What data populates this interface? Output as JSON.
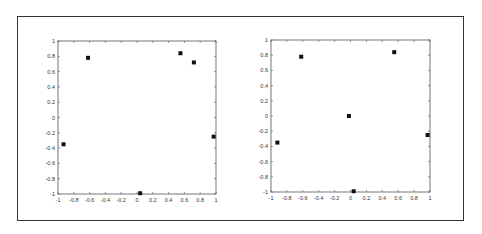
{
  "chart_data": [
    {
      "type": "scatter",
      "title": "",
      "xlabel": "",
      "ylabel": "",
      "xlim": [
        -1,
        1
      ],
      "ylim": [
        -1,
        1
      ],
      "grid": false,
      "marker": "square",
      "marker_color": "#111111",
      "x_ticks": [
        "-1",
        "-0.8",
        "-0.6",
        "-0.4",
        "-0.2",
        "0",
        "0.2",
        "0.4",
        "0.6",
        "0.8",
        "1"
      ],
      "y_ticks": [
        "1",
        "0.8",
        "0.6",
        "0.4",
        "0.2",
        "0",
        "-0.2",
        "-0.4",
        "-0.6",
        "-0.8",
        "-1"
      ],
      "points": [
        {
          "x": -0.93,
          "y": -0.35
        },
        {
          "x": -0.62,
          "y": 0.78
        },
        {
          "x": 0.04,
          "y": -0.99
        },
        {
          "x": 0.55,
          "y": 0.84
        },
        {
          "x": 0.72,
          "y": 0.72
        },
        {
          "x": 0.97,
          "y": -0.25
        }
      ]
    },
    {
      "type": "scatter",
      "title": "",
      "xlabel": "",
      "ylabel": "",
      "xlim": [
        -1,
        1
      ],
      "ylim": [
        -1,
        1
      ],
      "grid": false,
      "marker": "square",
      "marker_color": "#111111",
      "x_ticks": [
        "-1",
        "-0.8",
        "-0.6",
        "-0.4",
        "-0.2",
        "0",
        "0.2",
        "0.4",
        "0.6",
        "0.8",
        "1"
      ],
      "y_ticks": [
        "1",
        "0.8",
        "0.6",
        "0.4",
        "0.2",
        "0",
        "-0.2",
        "-0.4",
        "-0.6",
        "-0.8",
        "-1"
      ],
      "points": [
        {
          "x": -0.92,
          "y": -0.35
        },
        {
          "x": -0.62,
          "y": 0.78
        },
        {
          "x": -0.02,
          "y": 0.0
        },
        {
          "x": 0.04,
          "y": -0.99
        },
        {
          "x": 0.55,
          "y": 0.84
        },
        {
          "x": 0.97,
          "y": -0.25
        }
      ]
    }
  ]
}
